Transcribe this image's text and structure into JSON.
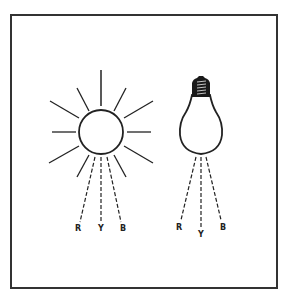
{
  "figure": {
    "sun": {
      "labels": [
        "R",
        "Y",
        "B"
      ]
    },
    "bulb": {
      "labels": [
        "R",
        "Y",
        "B"
      ]
    },
    "colors": {
      "line": "#222222",
      "frame": "#333333",
      "background": "#ffffff"
    }
  }
}
